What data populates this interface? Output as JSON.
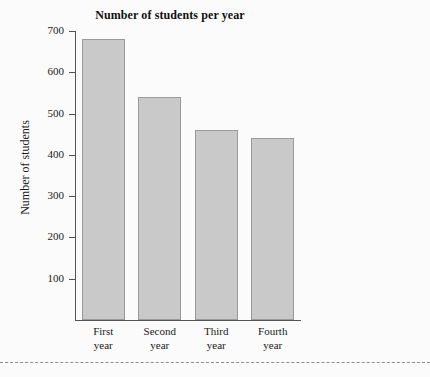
{
  "chart_data": {
    "type": "bar",
    "title": "Number of students per year",
    "xlabel": "",
    "ylabel": "Number of students",
    "categories": [
      "First year",
      "Second year",
      "Third year",
      "Fourth year"
    ],
    "category_lines": [
      [
        "First",
        "year"
      ],
      [
        "Second",
        "year"
      ],
      [
        "Third",
        "year"
      ],
      [
        "Fourth",
        "year"
      ]
    ],
    "values": [
      680,
      540,
      460,
      440
    ],
    "ylim": [
      0,
      700
    ],
    "yticks": [
      700,
      600,
      500,
      400,
      300,
      200,
      100
    ],
    "ytick_labels": [
      "700",
      "600",
      "500",
      "400",
      "300",
      "200",
      "100"
    ],
    "grid": false,
    "legend": "none",
    "bar_fill_color": "#c9c9c9",
    "bar_edge_color": "#9a9a9a",
    "axis_color": "#555555",
    "background_color": "#fbfbfb"
  }
}
